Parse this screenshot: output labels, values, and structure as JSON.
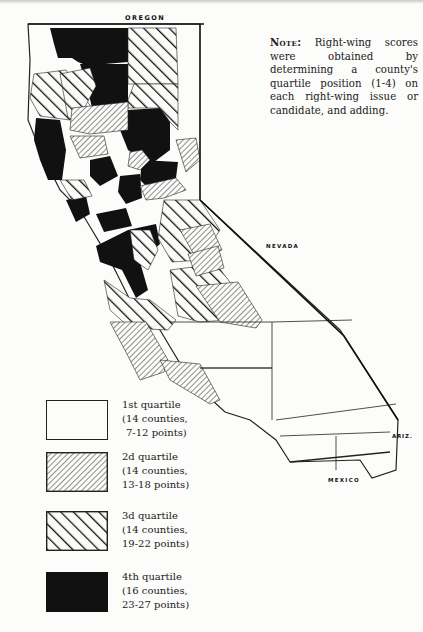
{
  "note": {
    "lead": "Note:",
    "text": "Right-wing scores were obtained by determining a county's quartile position (1-4) on each right-wing issue or candidate, and adding."
  },
  "map_labels": {
    "north_state": "OREGON",
    "east_state": "NEVADA",
    "southeast_state": "ARIZ.",
    "south_country": "MEXICO"
  },
  "legend": {
    "items": [
      {
        "id": "q1",
        "title": "1st quartile",
        "counties": "(14 counties,",
        "points": "7-12 points)",
        "pattern": "blank"
      },
      {
        "id": "q2",
        "title": "2d quartile",
        "counties": "(14 counties,",
        "points": "13-18 points)",
        "pattern": "fine-hatch"
      },
      {
        "id": "q3",
        "title": "3d quartile",
        "counties": "(14 counties,",
        "points": "19-22 points)",
        "pattern": "wide-hatch"
      },
      {
        "id": "q4",
        "title": "4th quartile",
        "counties": "(16 counties,",
        "points": "23-27 points)",
        "pattern": "solid-black"
      }
    ]
  },
  "colors": {
    "ink": "#111111",
    "paper": "#fcfcfa"
  }
}
